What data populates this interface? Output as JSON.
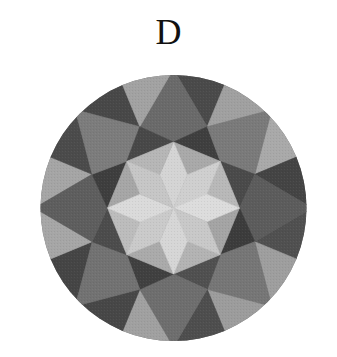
{
  "figure": {
    "label": "D"
  },
  "geometry": {
    "cx": 173.5,
    "cy": 208,
    "rim_r": 133,
    "table_r": 66,
    "star_r": 88,
    "petal_valley_r": 36
  },
  "shades": {
    "petal": [
      "#d4d4d4",
      "#cfcfcf",
      "#dcdcdc",
      "#c8c8c8",
      "#d6d6d6",
      "#cacaca",
      "#dadada",
      "#c6c6c6"
    ],
    "petal_side": [
      "#a9a9a9",
      "#b8b8b8",
      "#a4a4a4",
      "#b3b3b3",
      "#aaaaaa",
      "#bcbcbc",
      "#a6a6a6",
      "#b6b6b6"
    ],
    "star": [
      "#3f3f3f",
      "#4a4a4a",
      "#3c3c3c",
      "#505050",
      "#404040",
      "#4c4c4c",
      "#3e3e3e",
      "#484848"
    ],
    "bezel": [
      "#6a6a6a",
      "#7a7a7a",
      "#5c5c5c",
      "#767676",
      "#6e6e6e",
      "#727272",
      "#5e5e5e",
      "#7c7c7c"
    ],
    "girdle_a": [
      "#4a4a4a",
      "#a9a9a9",
      "#505050",
      "#9c9c9c",
      "#a0a0a0",
      "#454545",
      "#a5a5a5",
      "#484848"
    ],
    "girdle_b": [
      "#a0a0a0",
      "#444444",
      "#9e9e9e",
      "#4e4e4e",
      "#474747",
      "#a6a6a6",
      "#4b4b4b",
      "#a2a2a2"
    ]
  }
}
